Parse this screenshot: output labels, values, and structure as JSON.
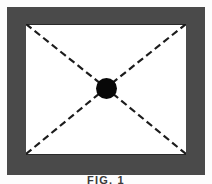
{
  "figure": {
    "caption": "FIG. 1",
    "alt_label": "framed rectangle with dashed diagonals and central node"
  },
  "colors": {
    "frame_gray": "#4a4a4a",
    "node_black": "#080808",
    "field_white": "#ffffff",
    "page_white": "#fdfdfd",
    "outline_dark": "#2a2a2a",
    "dash_dark": "#1c1c1c"
  },
  "diagram": {
    "type": "schematic",
    "frame": {
      "label": "border frame",
      "outer": {
        "x": 7,
        "y": 7,
        "width": 198,
        "height": 168
      },
      "band_thickness_top": 17,
      "band_thickness_bottom": 20,
      "band_thickness_left": 19,
      "band_thickness_right": 19
    },
    "field": {
      "label": "inner field",
      "x": 26,
      "y": 24,
      "width": 160,
      "height": 131
    },
    "node": {
      "label": "center node",
      "cx": 106,
      "cy": 88,
      "r": 10.5
    },
    "diagonals": [
      {
        "name": "diagonal-top-left-to-center",
        "x1": 0,
        "y1": 0,
        "x2": 80,
        "y2": 64
      },
      {
        "name": "diagonal-top-right-to-center",
        "x1": 160,
        "y1": 0,
        "x2": 80,
        "y2": 64
      },
      {
        "name": "diagonal-bottom-left-to-center",
        "x1": 0,
        "y1": 130,
        "x2": 80,
        "y2": 64
      },
      {
        "name": "diagonal-bottom-right-to-center",
        "x1": 160,
        "y1": 130,
        "x2": 80,
        "y2": 64
      }
    ],
    "dash_pattern": "7 4",
    "dash_width": 2.2
  }
}
